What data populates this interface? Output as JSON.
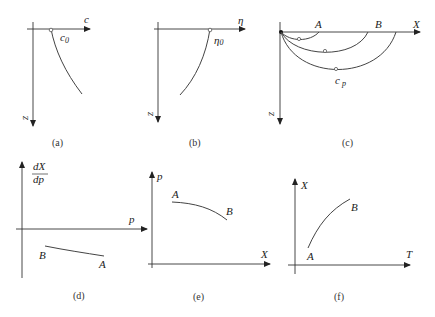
{
  "figure": {
    "panels": [
      {
        "id": "a",
        "caption": "(a)",
        "x_axis_label": "c",
        "y_axis_label": "z",
        "curve_label": "c",
        "curve_label_sub": "0",
        "description": "c vs depth z, starting at c0 at the surface"
      },
      {
        "id": "b",
        "caption": "(b)",
        "x_axis_label": "η",
        "y_axis_label": "z",
        "curve_label": "η",
        "curve_label_sub": "0",
        "description": "η vs depth z, starting at η0 at the surface"
      },
      {
        "id": "c",
        "caption": "(c)",
        "x_axis_label": "X",
        "y_axis_label": "z",
        "point_labels": [
          "A",
          "B"
        ],
        "curve_label": "c",
        "curve_label_sub": "p",
        "description": "ray paths from source returning to surface at A and B"
      },
      {
        "id": "d",
        "caption": "(d)",
        "x_axis_label": "p",
        "y_axis_label_num": "dX",
        "y_axis_label_den": "dp",
        "point_labels": [
          "B",
          "A"
        ],
        "description": "dX/dp negative, between B and A"
      },
      {
        "id": "e",
        "caption": "(e)",
        "x_axis_label": "X",
        "y_axis_label": "p",
        "point_labels": [
          "A",
          "B"
        ],
        "description": "p decreasing with X from A to B"
      },
      {
        "id": "f",
        "caption": "(f)",
        "x_axis_label": "T",
        "y_axis_label": "X",
        "point_labels": [
          "A",
          "B"
        ],
        "description": "X increasing with T from A to B"
      }
    ]
  }
}
